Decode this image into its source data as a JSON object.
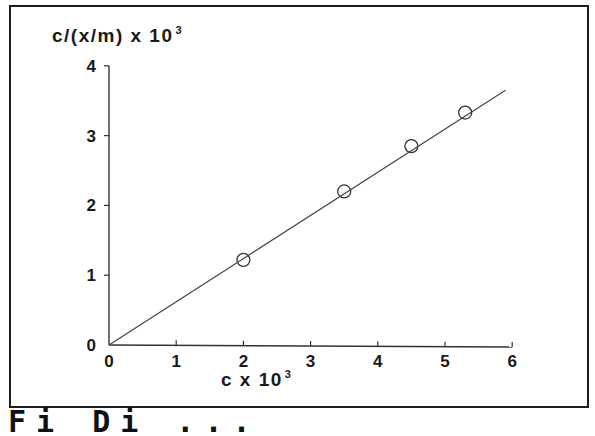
{
  "chart_data": {
    "type": "scatter",
    "title": "",
    "ylabel": "c/(x/m) x 10",
    "ylabel_exponent": "3",
    "xlabel": "c x 10",
    "xlabel_exponent": "3",
    "xlim": [
      0,
      6
    ],
    "ylim": [
      0,
      4
    ],
    "x_ticks": [
      "0",
      "1",
      "2",
      "3",
      "4",
      "5",
      "6"
    ],
    "y_ticks": [
      "0",
      "1",
      "2",
      "3",
      "4"
    ],
    "grid": false,
    "legend": null,
    "series": [
      {
        "name": "data",
        "marker": "open-circle",
        "x": [
          2.0,
          3.5,
          4.5,
          5.3
        ],
        "y": [
          1.22,
          2.2,
          2.85,
          3.33
        ]
      },
      {
        "name": "linear fit",
        "style": "line",
        "x": [
          0,
          5.9
        ],
        "y": [
          0,
          3.65
        ]
      }
    ]
  },
  "caption_fragment": "Fi   Di   ..."
}
